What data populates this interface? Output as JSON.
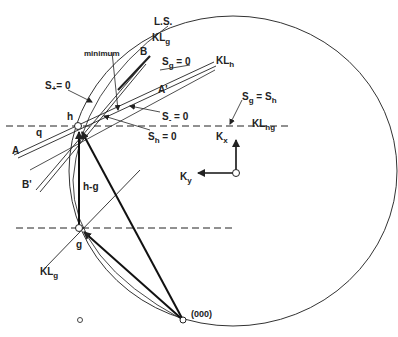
{
  "diagram": {
    "labels": {
      "ls": "L.S.",
      "klg_top": "KL",
      "klg_top_sub": "g",
      "minimum": "minimum",
      "b": "B",
      "sg0": "S",
      "sg0_sub": "g",
      "sg0_eq": " = 0",
      "klh": "KL",
      "klh_sub": "h",
      "splus": "S",
      "splus_sub": "+",
      "splus_eq": "= 0",
      "aprime": "A'",
      "h": "h",
      "sminus": "S",
      "sminus_sub": "-",
      "sminus_eq": " = 0",
      "sgsh_a": "S",
      "sgsh_a_sub": "g",
      "sgsh_eq": " = S",
      "sgsh_b_sub": "h",
      "q": "q",
      "sh0": "S",
      "sh0_sub": "h",
      "sh0_eq": " = 0",
      "klhg": "KL",
      "klhg_sub": "hg",
      "a": "A",
      "kx": "K",
      "kx_sub": "x",
      "bprime": "B'",
      "ky": "K",
      "ky_sub": "y",
      "hg": "h-g",
      "g": "g",
      "klg_bottom": "KL",
      "klg_bottom_sub": "g",
      "origin": "(000)"
    },
    "points": {
      "origin": [
        183,
        320
      ],
      "h": [
        78,
        126
      ],
      "g": [
        79,
        228
      ],
      "axis_origin": [
        236,
        173
      ],
      "small_circle": [
        80,
        320
      ]
    },
    "colors": {
      "line": "#222222",
      "background": "#ffffff"
    }
  }
}
